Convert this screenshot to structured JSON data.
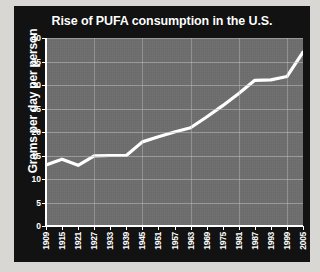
{
  "chart_data": {
    "type": "line",
    "title": "Rise of PUFA consumption in the U.S.",
    "xlabel": "",
    "ylabel": "Grams per day per person",
    "ylim": [
      0,
      40
    ],
    "ytick_labels": [
      "0",
      "5",
      "10",
      "15",
      "20",
      "25",
      "30",
      "35",
      "40"
    ],
    "ytick_values": [
      0,
      5,
      10,
      15,
      20,
      25,
      30,
      35,
      40
    ],
    "grid": true,
    "legend": "none",
    "categories": [
      "1909",
      "1915",
      "1921",
      "1927",
      "1933",
      "1939",
      "1945",
      "1951",
      "1957",
      "1963",
      "1969",
      "1975",
      "1981",
      "1987",
      "1993",
      "1999",
      "2005"
    ],
    "values": [
      13.0,
      14.2,
      12.9,
      14.9,
      15.0,
      15.0,
      17.9,
      19.0,
      20.0,
      20.9,
      23.2,
      25.6,
      28.2,
      31.0,
      31.1,
      31.8,
      37.0
    ],
    "line_color": "#ffffff",
    "plot_background": "#6e6e6e",
    "figure_background": "#121212",
    "text_color": "#ffffff"
  }
}
